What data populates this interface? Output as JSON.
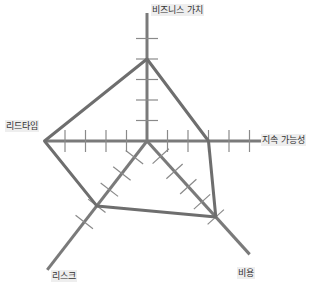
{
  "chart_data": {
    "type": "radar",
    "title": "",
    "categories": [
      "비즈니스 가치",
      "지속 가능성",
      "비용",
      "리스크",
      "리드타임"
    ],
    "series": [
      {
        "name": "",
        "values": [
          4,
          3,
          5,
          4,
          5
        ]
      }
    ],
    "range": [
      0,
      5
    ],
    "ticks_per_axis": 5,
    "grid": false,
    "legend": "none",
    "colors": {
      "axis": "#7a7a7a",
      "polygon": "#6e6e6e",
      "tick": "#8a8a8a",
      "label_bg": "#eeeeee",
      "label_text": "#333333"
    }
  },
  "labels": {
    "business_value": "비즈니스 가치",
    "sustainability": "지속 가능성",
    "cost": "비용",
    "risk": "리스크",
    "lead_time": "리드타임"
  }
}
